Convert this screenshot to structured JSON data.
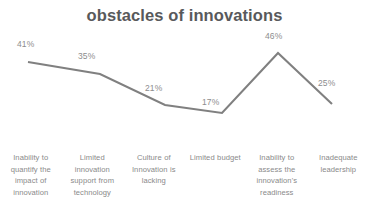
{
  "chart_data": {
    "type": "line",
    "title": "obstacles of innovations",
    "xlabel": "",
    "ylabel": "",
    "ylim": [
      0,
      50
    ],
    "grid": false,
    "legend": false,
    "legend_position": "none",
    "line_color": "#808080",
    "label_color": "#8d8d8d",
    "title_color": "#58595b",
    "categories": [
      "Inability to quantify the impact of innovation",
      "Limited innovation support from technology",
      "Culture of Innovation is lacking",
      "Limited budget",
      "Inability to assess the innovation's readiness",
      "Inadequate leadership"
    ],
    "values": [
      41,
      35,
      21,
      17,
      46,
      25
    ],
    "data_labels": [
      "41%",
      "35%",
      "21%",
      "17%",
      "46%",
      "25%"
    ],
    "points": [
      {
        "x": 28,
        "y": 62,
        "label": "41%",
        "label_x": 17,
        "label_y": 39
      },
      {
        "x": 100,
        "y": 74,
        "label": "35%",
        "label_x": 78,
        "label_y": 51
      },
      {
        "x": 165,
        "y": 105,
        "label": "21%",
        "label_x": 145,
        "label_y": 83
      },
      {
        "x": 222,
        "y": 113,
        "label": "17%",
        "label_x": 202,
        "label_y": 97
      },
      {
        "x": 278,
        "y": 53,
        "label": "46%",
        "label_x": 265,
        "label_y": 31
      },
      {
        "x": 332,
        "y": 104,
        "label": "25%",
        "label_x": 318,
        "label_y": 78
      }
    ]
  }
}
